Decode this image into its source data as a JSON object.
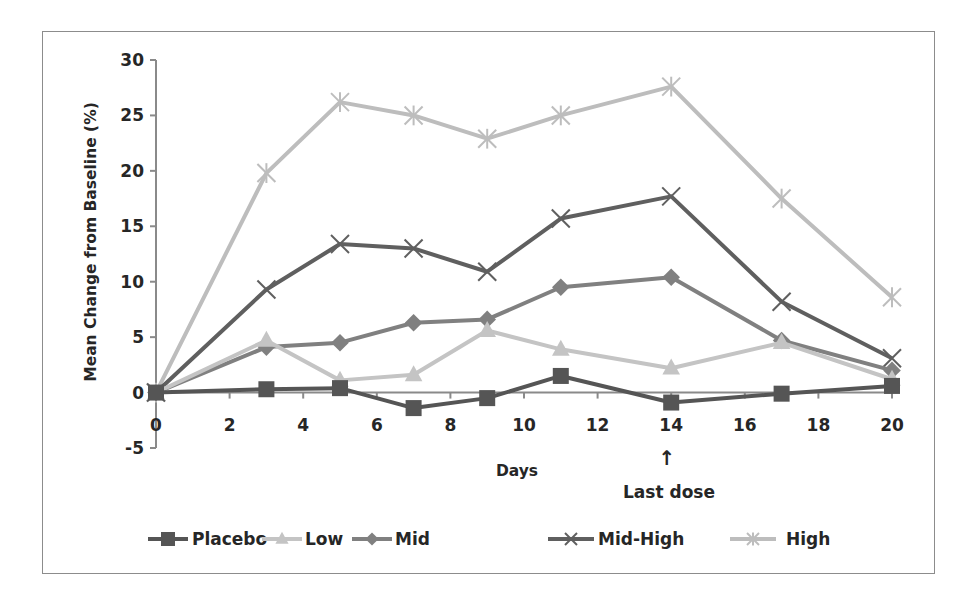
{
  "chart_data": {
    "type": "line",
    "title": "",
    "xlabel": "Days",
    "ylabel": "Mean Change from Baseline (%)",
    "xlim": [
      0,
      20
    ],
    "ylim": [
      -5,
      30
    ],
    "xticks": [
      0,
      2,
      4,
      6,
      8,
      10,
      12,
      14,
      16,
      18,
      20
    ],
    "yticks": [
      -5,
      0,
      5,
      10,
      15,
      20,
      25,
      30
    ],
    "grid": false,
    "legend_position": "bottom",
    "annotation": {
      "text": "Last dose",
      "arrow": "↑",
      "x": 14
    },
    "x": [
      0,
      3,
      5,
      7,
      9,
      11,
      14,
      17,
      20
    ],
    "series": [
      {
        "name": "Placebo",
        "marker": "square",
        "color": "#555555",
        "values": [
          0,
          0.3,
          0.4,
          -1.4,
          -0.5,
          1.5,
          -0.9,
          -0.1,
          0.6
        ]
      },
      {
        "name": "Low",
        "marker": "triangle",
        "color": "#c4c4c4",
        "values": [
          0,
          4.7,
          1.1,
          1.6,
          5.6,
          3.9,
          2.2,
          4.5,
          1.2
        ]
      },
      {
        "name": "Mid",
        "marker": "diamond",
        "color": "#808080",
        "values": [
          0,
          4.1,
          4.5,
          6.3,
          6.6,
          9.5,
          10.4,
          4.7,
          2.0
        ]
      },
      {
        "name": "Mid-High",
        "marker": "x",
        "color": "#5f5f5f",
        "values": [
          0,
          9.3,
          13.4,
          13.0,
          10.9,
          15.7,
          17.7,
          8.2,
          3.1
        ]
      },
      {
        "name": "High",
        "marker": "asterisk",
        "color": "#bdbdbd",
        "values": [
          0,
          19.8,
          26.2,
          25.0,
          22.9,
          25.0,
          27.6,
          17.5,
          8.6
        ]
      }
    ]
  },
  "colors": {
    "axis": "#8a8a8a",
    "text": "#262626",
    "border": "#8c8c8c"
  }
}
